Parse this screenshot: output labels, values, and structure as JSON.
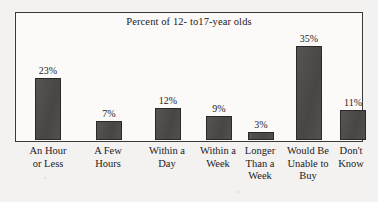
{
  "chart_data": {
    "type": "bar",
    "title": "Percent of 12- to17-year olds",
    "xlabel": "",
    "ylabel": "",
    "ylim": [
      0,
      38
    ],
    "grid": false,
    "legend": null,
    "categories": [
      "An Hour or Less",
      "A Few Hours",
      "Within a Day",
      "Within a Week",
      "Longer Than a Week",
      "Would Be Unable to Buy",
      "Don't Know"
    ],
    "category_lines": [
      [
        "An Hour",
        "or Less"
      ],
      [
        "A Few",
        "Hours"
      ],
      [
        "Within a",
        "Day"
      ],
      [
        "Within a",
        "Week"
      ],
      [
        "Longer",
        "Than a",
        "Week"
      ],
      [
        "Would Be",
        "Unable to",
        "Buy"
      ],
      [
        "Don't",
        "Know"
      ]
    ],
    "values": [
      23,
      7,
      12,
      9,
      3,
      35,
      11
    ],
    "value_labels": [
      "23%",
      "7%",
      "12%",
      "9%",
      "3%",
      "35%",
      "11%"
    ]
  },
  "style": {
    "bar_fill": "#4c4a49",
    "bar_stroke": "#2a2927",
    "frame_stroke": "#3a3a3a",
    "plot_background": "#fbfaf8",
    "page_background": "#f3f2f0",
    "text_color": "#23201e"
  }
}
